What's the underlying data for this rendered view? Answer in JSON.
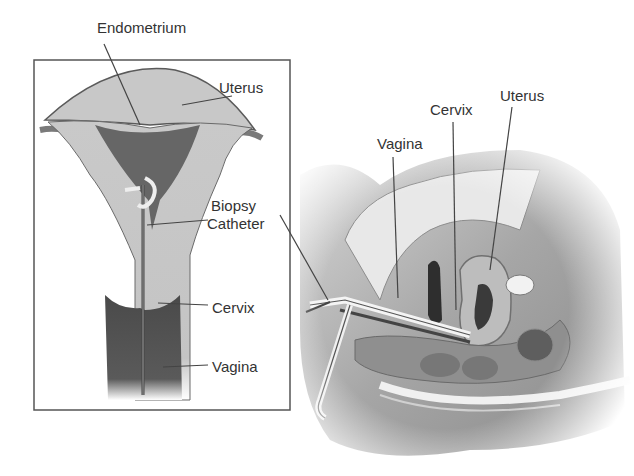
{
  "diagram": {
    "left_panel": {
      "labels": {
        "endometrium": "Endometrium",
        "uterus": "Uterus",
        "biopsy_line1": "Biopsy",
        "biopsy_line2": "Catheter",
        "cervix": "Cervix",
        "vagina": "Vagina"
      }
    },
    "right_panel": {
      "labels": {
        "vagina": "Vagina",
        "cervix": "Cervix",
        "uterus": "Uterus"
      }
    }
  }
}
